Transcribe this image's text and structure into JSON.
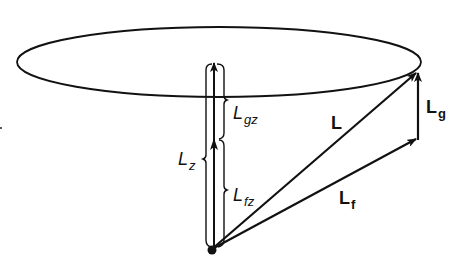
{
  "diagram": {
    "colors": {
      "stroke": "#111111",
      "background": "#ffffff"
    },
    "labels": {
      "L": {
        "main": "L",
        "sub": ""
      },
      "Lg": {
        "main": "L",
        "sub": "g"
      },
      "Lf": {
        "main": "L",
        "sub": "f"
      },
      "Lz": {
        "main": "L",
        "sub": "z"
      },
      "Lgz": {
        "main": "L",
        "sub": "gz"
      },
      "Lfz": {
        "main": "L",
        "sub": "fz"
      }
    },
    "elements": [
      {
        "name": "precession-ellipse",
        "type": "ellipse",
        "cx": 219,
        "cy": 62,
        "rx": 202,
        "ry": 35
      },
      {
        "name": "vector-L",
        "type": "arrow",
        "from": [
          212,
          249
        ],
        "to": [
          417,
          72
        ]
      },
      {
        "name": "vector-Lf",
        "type": "arrow",
        "from": [
          212,
          249
        ],
        "to": [
          417,
          139
        ]
      },
      {
        "name": "vector-Lg",
        "type": "arrow",
        "from": [
          418,
          139
        ],
        "to": [
          418,
          72
        ]
      },
      {
        "name": "vector-Lz",
        "type": "arrow",
        "from": [
          214,
          249
        ],
        "to": [
          214,
          62
        ]
      },
      {
        "name": "origin-point",
        "type": "dot",
        "at": [
          212,
          250
        ]
      }
    ]
  }
}
